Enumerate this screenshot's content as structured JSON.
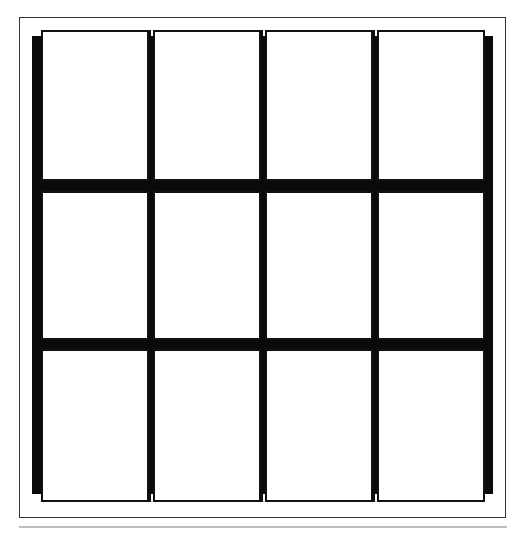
{
  "diagram": {
    "type": "window-grid",
    "rows": 3,
    "columns": 4,
    "colors": {
      "background": "#ffffff",
      "frame": "#333333",
      "mullion": "#0a0a0a",
      "pane_border": "#111111",
      "rule": "#bdbdbd"
    },
    "cells": [
      {
        "row": 1,
        "col": 1
      },
      {
        "row": 1,
        "col": 2
      },
      {
        "row": 1,
        "col": 3
      },
      {
        "row": 1,
        "col": 4
      },
      {
        "row": 2,
        "col": 1
      },
      {
        "row": 2,
        "col": 2
      },
      {
        "row": 2,
        "col": 3
      },
      {
        "row": 2,
        "col": 4
      },
      {
        "row": 3,
        "col": 1
      },
      {
        "row": 3,
        "col": 2
      },
      {
        "row": 3,
        "col": 3
      },
      {
        "row": 3,
        "col": 4
      }
    ]
  }
}
